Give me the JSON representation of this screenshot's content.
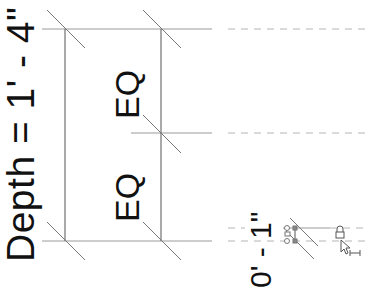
{
  "drawing": {
    "depth_label": "Depth = 1' - 4\"",
    "eq_top": "EQ",
    "eq_bottom": "EQ",
    "small_dimension": "0' - 1\"",
    "colors": {
      "line": "#555555",
      "reference_line": "#9a9a9a",
      "text": "#111111"
    }
  },
  "cursor": {
    "icon": "lock-cursor-icon",
    "tool": "dimension-icon"
  }
}
